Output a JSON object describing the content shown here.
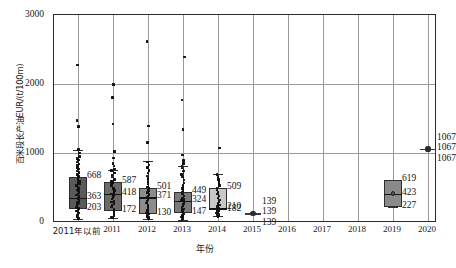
{
  "chart_data": {
    "type": "box",
    "title": "",
    "xlabel": "年份",
    "ylabel": "百米段长产油EUR/(t/100m)",
    "ylim": [
      0,
      3000
    ],
    "yticks": [
      0,
      1000,
      2000,
      3000
    ],
    "ytick_labels": [
      "0",
      "1000",
      "2000",
      "3000"
    ],
    "grid": "both",
    "legend": "none",
    "categories": [
      "2011年以前",
      "2011",
      "2012",
      "2013",
      "2014",
      "2015",
      "2016",
      "2017",
      "2018",
      "2019",
      "2020"
    ],
    "boxes": [
      {
        "category": "2011年以前",
        "q3": 668,
        "median": 363,
        "q1": 203,
        "whisker_low": 60,
        "whisker_high": 1060,
        "fill": "#5a5a5a",
        "labels": [
          "668",
          "363",
          "203"
        ]
      },
      {
        "category": "2011",
        "q3": 587,
        "median": 418,
        "q1": 172,
        "whisker_low": 70,
        "whisker_high": 760,
        "fill": "#6a6a6a",
        "labels": [
          "587",
          "418",
          "172"
        ]
      },
      {
        "category": "2012",
        "q3": 501,
        "median": 371,
        "q1": 130,
        "whisker_low": 55,
        "whisker_high": 900,
        "fill": "#8c8c8c",
        "labels": [
          "501",
          "371",
          "130"
        ]
      },
      {
        "category": "2013",
        "q3": 449,
        "median": 324,
        "q1": 147,
        "whisker_low": 50,
        "whisker_high": 820,
        "fill": "#7a7a7a",
        "labels": [
          "449",
          "324",
          "147"
        ]
      },
      {
        "category": "2014",
        "q3": 509,
        "median": 210,
        "q1": 182,
        "whisker_low": 95,
        "whisker_high": 700,
        "fill": "#c8c8c8",
        "labels": [
          "509",
          "210",
          "182"
        ]
      },
      {
        "category": "2015",
        "q3": 139,
        "median": 139,
        "q1": 139,
        "whisker_low": 139,
        "whisker_high": 139,
        "fill": "#6a6a6a",
        "labels": [
          "139",
          "139",
          "139"
        ],
        "single_point": true
      },
      {
        "category": "2019",
        "q3": 619,
        "median": 423,
        "q1": 227,
        "whisker_low": 227,
        "whisker_high": 619,
        "fill": "#8a8a8a",
        "labels": [
          "619",
          "423",
          "227"
        ]
      },
      {
        "category": "2020",
        "q3": 1067,
        "median": 1067,
        "q1": 1067,
        "whisker_low": 1067,
        "whisker_high": 1067,
        "fill": "#6a6a6a",
        "labels": [
          "1067",
          "1067",
          "1067"
        ],
        "single_point": true
      }
    ],
    "empty_categories": [
      "2016",
      "2017",
      "2018"
    ],
    "scatter": {
      "2011年以前": [
        2280,
        1480,
        1390,
        1060,
        1010,
        960,
        930,
        905,
        880,
        855,
        830,
        800,
        775,
        750,
        730,
        700,
        690,
        668,
        640,
        620,
        600,
        585,
        560,
        540,
        520,
        500,
        480,
        460,
        440,
        420,
        400,
        380,
        363,
        350,
        330,
        315,
        300,
        285,
        270,
        255,
        240,
        225,
        210,
        203,
        190,
        175,
        160,
        145,
        130,
        115,
        100,
        85,
        70,
        60
      ],
      "2011": [
        2000,
        1810,
        1430,
        1030,
        940,
        860,
        820,
        780,
        760,
        720,
        690,
        660,
        630,
        600,
        587,
        560,
        530,
        500,
        470,
        450,
        430,
        418,
        395,
        370,
        345,
        320,
        300,
        280,
        255,
        230,
        205,
        185,
        172,
        150,
        130,
        110,
        90,
        70
      ],
      "2012": [
        2620,
        1400,
        1160,
        880,
        840,
        800,
        760,
        720,
        680,
        640,
        600,
        560,
        520,
        501,
        470,
        440,
        410,
        390,
        371,
        340,
        310,
        285,
        255,
        230,
        205,
        180,
        160,
        145,
        130,
        110,
        95,
        80,
        65,
        55
      ],
      "2013": [
        2390,
        1770,
        1350,
        980,
        900,
        860,
        820,
        790,
        750,
        700,
        660,
        620,
        580,
        540,
        500,
        460,
        449,
        420,
        390,
        360,
        340,
        324,
        300,
        275,
        250,
        225,
        200,
        180,
        160,
        147,
        130,
        110,
        90,
        70,
        50
      ],
      "2014": [
        1080,
        700,
        660,
        630,
        600,
        570,
        540,
        509,
        480,
        450,
        420,
        390,
        360,
        330,
        300,
        280,
        260,
        240,
        225,
        210,
        200,
        195,
        190,
        185,
        182,
        175,
        165,
        155,
        145,
        135,
        120,
        110,
        100,
        95
      ]
    }
  }
}
